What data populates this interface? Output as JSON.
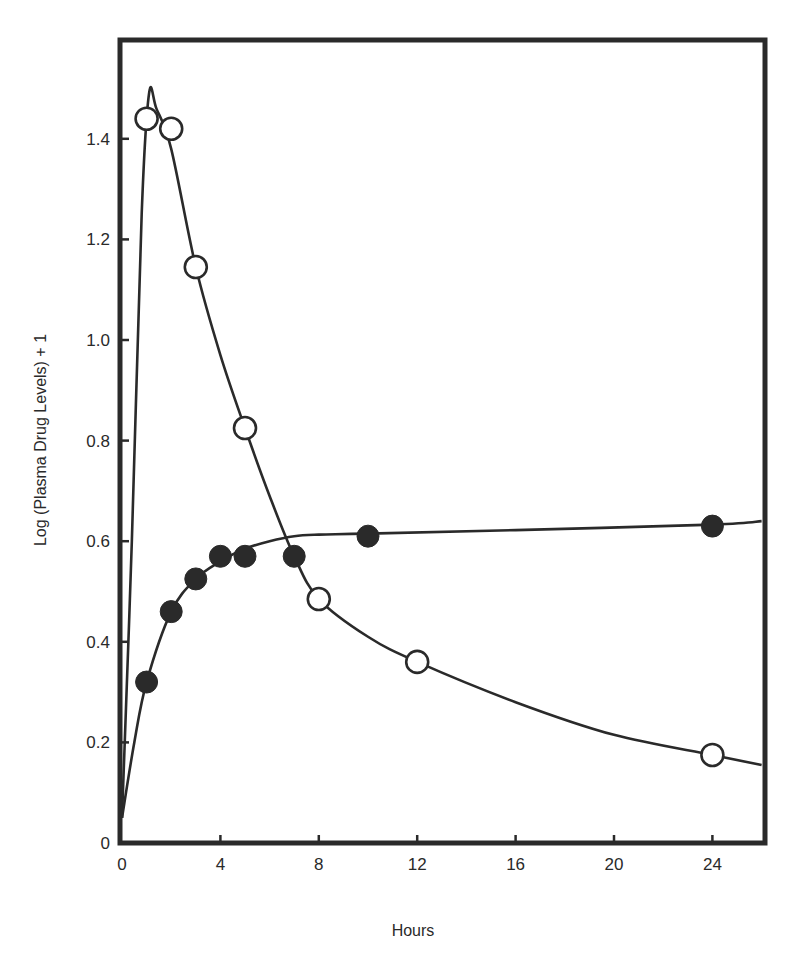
{
  "chart_data": {
    "type": "line",
    "title": "",
    "xlabel": "Hours",
    "ylabel": "Log (Plasma Drug Levels) + 1",
    "xlim": [
      0,
      26
    ],
    "ylim": [
      0,
      1.5
    ],
    "x_ticks": [
      0,
      4,
      8,
      12,
      16,
      20,
      24
    ],
    "x_tick_labels": [
      "0",
      "4",
      "8",
      "12",
      "16",
      "20",
      "24"
    ],
    "y_ticks": [
      0,
      0.2,
      0.4,
      0.6,
      0.8,
      1.0,
      1.2,
      1.4
    ],
    "y_tick_labels": [
      "0",
      "0.2",
      "0.4",
      "0.6",
      "0.8",
      "1.0",
      "1.2",
      "1.4"
    ],
    "grid": false,
    "legend": null,
    "series": [
      {
        "name": "open circles",
        "marker": "open-circle",
        "x": [
          1,
          2,
          3,
          5,
          8,
          12,
          24
        ],
        "values": [
          1.44,
          1.42,
          1.145,
          0.825,
          0.485,
          0.36,
          0.175
        ],
        "fitted_curve": [
          [
            0,
            0.05
          ],
          [
            0.4,
            0.6
          ],
          [
            0.8,
            1.25
          ],
          [
            1.1,
            1.49
          ],
          [
            1.4,
            1.46
          ],
          [
            2,
            1.38
          ],
          [
            3,
            1.145
          ],
          [
            4,
            0.97
          ],
          [
            5,
            0.825
          ],
          [
            6,
            0.69
          ],
          [
            7,
            0.57
          ],
          [
            8,
            0.485
          ],
          [
            10,
            0.41
          ],
          [
            12,
            0.36
          ],
          [
            16,
            0.28
          ],
          [
            20,
            0.215
          ],
          [
            24,
            0.175
          ],
          [
            26,
            0.155
          ]
        ]
      },
      {
        "name": "filled circles",
        "marker": "filled-circle",
        "x": [
          1,
          2,
          3,
          4,
          5,
          7,
          10,
          24
        ],
        "values": [
          0.32,
          0.46,
          0.525,
          0.57,
          0.57,
          0.57,
          0.61,
          0.63
        ],
        "fitted_curve": [
          [
            0,
            0.05
          ],
          [
            0.5,
            0.2
          ],
          [
            1,
            0.32
          ],
          [
            2,
            0.46
          ],
          [
            3,
            0.525
          ],
          [
            4,
            0.56
          ],
          [
            5,
            0.585
          ],
          [
            6,
            0.6
          ],
          [
            7,
            0.61
          ],
          [
            8,
            0.613
          ],
          [
            10,
            0.615
          ],
          [
            16,
            0.622
          ],
          [
            24,
            0.633
          ],
          [
            26,
            0.64
          ]
        ]
      }
    ]
  },
  "colors": {
    "ink": "#2a2a2a",
    "background": "#ffffff"
  }
}
